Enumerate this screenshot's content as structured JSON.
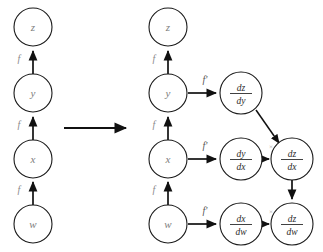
{
  "figure": {
    "background_color": "#ffffff",
    "node_stroke_color": "#1a1a1a",
    "node_label_color": "#7d7d7d",
    "edge_color": "#111111",
    "edge_label_color": "#8a8a8a"
  },
  "left_graph": {
    "name": "forward-chain",
    "nodes": [
      {
        "id": "z",
        "label": "z",
        "cx": 33,
        "cy": 27,
        "r": 19
      },
      {
        "id": "y",
        "label": "y",
        "cx": 33,
        "cy": 93,
        "r": 19
      },
      {
        "id": "x",
        "label": "x",
        "cx": 33,
        "cy": 159,
        "r": 19
      },
      {
        "id": "w",
        "label": "w",
        "cx": 33,
        "cy": 224,
        "r": 19
      }
    ],
    "edges": [
      {
        "from": "y",
        "to": "z",
        "label": "f",
        "label_x": 19,
        "label_y": 60
      },
      {
        "from": "x",
        "to": "y",
        "label": "f",
        "label_x": 19,
        "label_y": 126
      },
      {
        "from": "w",
        "to": "x",
        "label": "f",
        "label_x": 19,
        "label_y": 191
      }
    ]
  },
  "transition": {
    "name": "transition-arrow",
    "x1": 64,
    "x2": 128,
    "y": 128
  },
  "right_graph": {
    "name": "derivative-chain",
    "nodes": [
      {
        "id": "z2",
        "label": "z",
        "type": "var",
        "cx": 168,
        "cy": 27,
        "r": 19
      },
      {
        "id": "y2",
        "label": "y",
        "type": "var",
        "cx": 168,
        "cy": 93,
        "r": 19
      },
      {
        "id": "x2",
        "label": "x",
        "type": "var",
        "cx": 168,
        "cy": 159,
        "r": 19
      },
      {
        "id": "w2",
        "label": "w",
        "type": "var",
        "cx": 168,
        "cy": 224,
        "r": 19
      },
      {
        "id": "dzdy",
        "num": "dz",
        "den": "dy",
        "type": "frac",
        "cx": 241,
        "cy": 93,
        "r": 21
      },
      {
        "id": "dydx",
        "num": "dy",
        "den": "dx",
        "type": "frac",
        "cx": 241,
        "cy": 159,
        "r": 21
      },
      {
        "id": "dxdw",
        "num": "dx",
        "den": "dw",
        "type": "frac",
        "cx": 241,
        "cy": 224,
        "r": 21
      },
      {
        "id": "dzdx",
        "num": "dz",
        "den": "dx",
        "type": "frac",
        "cx": 292,
        "cy": 159,
        "r": 21
      },
      {
        "id": "dzdw",
        "num": "dz",
        "den": "dw",
        "type": "frac",
        "cx": 292,
        "cy": 224,
        "r": 21
      }
    ],
    "edges": [
      {
        "from": "y2",
        "to": "z2",
        "label": "f",
        "label_x": 154,
        "label_y": 60
      },
      {
        "from": "x2",
        "to": "y2",
        "label": "f",
        "label_x": 154,
        "label_y": 126
      },
      {
        "from": "w2",
        "to": "x2",
        "label": "f",
        "label_x": 154,
        "label_y": 191
      },
      {
        "from": "y2",
        "to": "dzdy",
        "label": "f'",
        "label_x": 205,
        "label_y": 81
      },
      {
        "from": "x2",
        "to": "dydx",
        "label": "f'",
        "label_x": 205,
        "label_y": 147
      },
      {
        "from": "w2",
        "to": "dxdw",
        "label": "f'",
        "label_x": 205,
        "label_y": 212
      },
      {
        "from": "dydx",
        "to": "dzdx",
        "label": "×",
        "label_x": 268,
        "label_y": 147
      },
      {
        "from": "dzdy",
        "to": "dzdx",
        "label": "",
        "label_x": 0,
        "label_y": 0
      },
      {
        "from": "dxdw",
        "to": "dzdw",
        "label": "×",
        "label_x": 268,
        "label_y": 212
      },
      {
        "from": "dzdx",
        "to": "dzdw",
        "label": "",
        "label_x": 0,
        "label_y": 0
      }
    ]
  }
}
